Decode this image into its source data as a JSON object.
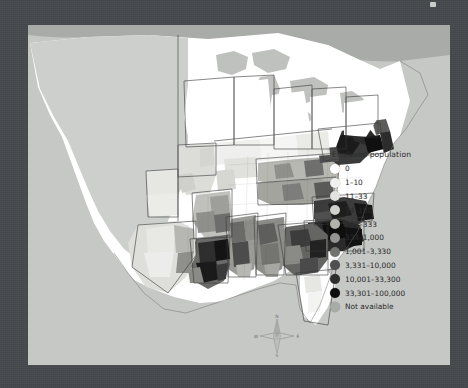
{
  "map": {
    "title": "Enslaved population choropleth map of the eastern United States",
    "background_color": "#45484c",
    "panel_color": "#cfd1ce",
    "ocean_color": "#c6c8c5"
  },
  "legend": {
    "title": "Enslaved population",
    "entries": [
      {
        "label": "0",
        "color": "#ffffff"
      },
      {
        "label": "1–10",
        "color": "#f0f0ee"
      },
      {
        "label": "11–33",
        "color": "#e2e2df"
      },
      {
        "label": "34–100",
        "color": "#cfcfcb"
      },
      {
        "label": "101–333",
        "color": "#b3b3ae"
      },
      {
        "label": "334–1,000",
        "color": "#949490"
      },
      {
        "label": "1,001–3,330",
        "color": "#727271"
      },
      {
        "label": "3,331–10,000",
        "color": "#4f4f4f"
      },
      {
        "label": "10,001–33,300",
        "color": "#2e2e2e"
      },
      {
        "label": "33,301–100,000",
        "color": "#0d0d0d"
      },
      {
        "label": "Not available",
        "color": "#a9aba8"
      }
    ]
  },
  "compass": {
    "north": "N",
    "south": "S",
    "east": "E",
    "west": "W"
  }
}
